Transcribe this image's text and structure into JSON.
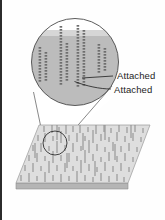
{
  "figure": {
    "background_color": "#fefefe",
    "border_color": "#2b2b2b"
  },
  "labels": [
    {
      "id": "attached-top",
      "text": "Attached",
      "leader_from": [
        111,
        75
      ],
      "leader_to": [
        82,
        78
      ],
      "color": "#1d1d1d"
    },
    {
      "id": "attached-bottom",
      "text": "Attached",
      "leader_from": [
        110,
        89
      ],
      "leader_to": [
        76,
        80
      ],
      "color": "#1d1d1d"
    }
  ],
  "magnifier": {
    "center": [
      75,
      62
    ],
    "radius": 44,
    "outline_color": "#4a4a4a",
    "substrate_fill": "#b9b9b9",
    "upper_fill": "#d4d4d4",
    "substrate_top_y": 36,
    "chain_color": "#6e6e6e",
    "chain_columns": [
      {
        "x": 40,
        "top": 47,
        "bottom": 80,
        "beads": 12
      },
      {
        "x": 46,
        "top": 52,
        "bottom": 78,
        "beads": 10
      },
      {
        "x": 61,
        "top": 26,
        "bottom": 82,
        "beads": 20
      },
      {
        "x": 67,
        "top": 43,
        "bottom": 79,
        "beads": 13
      },
      {
        "x": 78,
        "top": 25,
        "bottom": 84,
        "beads": 21
      },
      {
        "x": 84,
        "top": 30,
        "bottom": 83,
        "beads": 19
      },
      {
        "x": 99,
        "top": 44,
        "bottom": 72,
        "beads": 10
      },
      {
        "x": 105,
        "top": 48,
        "bottom": 70,
        "beads": 8
      }
    ]
  },
  "cone": {
    "apex_left": [
      43,
      139
    ],
    "apex_right": [
      66,
      139
    ],
    "color": "#555555"
  },
  "detail_circle": {
    "center": [
      55,
      143
    ],
    "radius": 12,
    "outline_color": "#2e2e2e"
  },
  "slab": {
    "top_face_fill": "#dedede",
    "top_face_stroke": "#8e8e8e",
    "side_face_fill": "#c3c3c3",
    "edge_face_fill": "#b0b0b0",
    "corners": {
      "back_left": [
        39,
        125
      ],
      "back_right": [
        150,
        125
      ],
      "front_right": [
        128,
        183
      ],
      "front_left": [
        16,
        183
      ]
    },
    "thickness": 6,
    "rod_color": "#8f8f8f",
    "rod_count": 168,
    "description": "Parallelogram substrate plate rendered in perspective bearing many short attached chains"
  },
  "colors": {
    "accent_dark": "#2b2b2b",
    "substrate_gray": "#b9b9b9",
    "plate_gray": "#dedede",
    "chain_gray": "#6e6e6e",
    "text": "#1d1d1d"
  }
}
